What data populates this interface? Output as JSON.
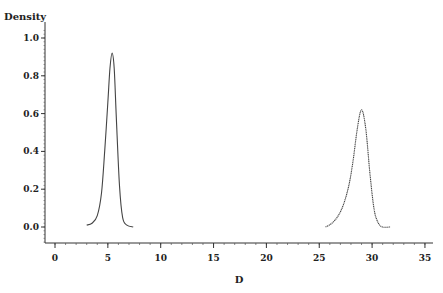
{
  "chart_data": {
    "type": "line",
    "title": "",
    "xlabel": "D",
    "ylabel": "Density",
    "xlim": [
      0,
      35
    ],
    "ylim": [
      -0.1,
      1.05
    ],
    "x_ticks": [
      0,
      5,
      10,
      15,
      20,
      25,
      30,
      35
    ],
    "x_tick_labels": [
      "0",
      "5",
      "10",
      "15",
      "20",
      "25",
      "30",
      "35"
    ],
    "y_ticks": [
      0.0,
      0.2,
      0.4,
      0.6,
      0.8,
      1.0
    ],
    "y_tick_labels": [
      "0.0",
      "0.2",
      "0.4",
      "0.6",
      "0.8",
      "1.0"
    ],
    "grid": false,
    "legend": null,
    "series": [
      {
        "name": "density-mode-1",
        "style": "solid",
        "peak": {
          "x": 5.4,
          "y": 0.92
        },
        "x": [
          3.0,
          3.5,
          4.0,
          4.4,
          4.7,
          5.0,
          5.2,
          5.4,
          5.6,
          5.8,
          6.1,
          6.4,
          6.8,
          7.4
        ],
        "y": [
          0.01,
          0.02,
          0.06,
          0.18,
          0.4,
          0.66,
          0.84,
          0.92,
          0.84,
          0.58,
          0.22,
          0.05,
          0.01,
          0.0
        ]
      },
      {
        "name": "density-mode-2",
        "style": "dotted",
        "peak": {
          "x": 29.0,
          "y": 0.62
        },
        "x": [
          25.6,
          26.2,
          26.8,
          27.3,
          27.8,
          28.2,
          28.6,
          29.0,
          29.4,
          29.8,
          30.2,
          30.6,
          31.0,
          31.7
        ],
        "y": [
          0.0,
          0.02,
          0.06,
          0.12,
          0.22,
          0.35,
          0.52,
          0.62,
          0.52,
          0.28,
          0.09,
          0.02,
          0.0,
          0.0
        ]
      }
    ]
  }
}
